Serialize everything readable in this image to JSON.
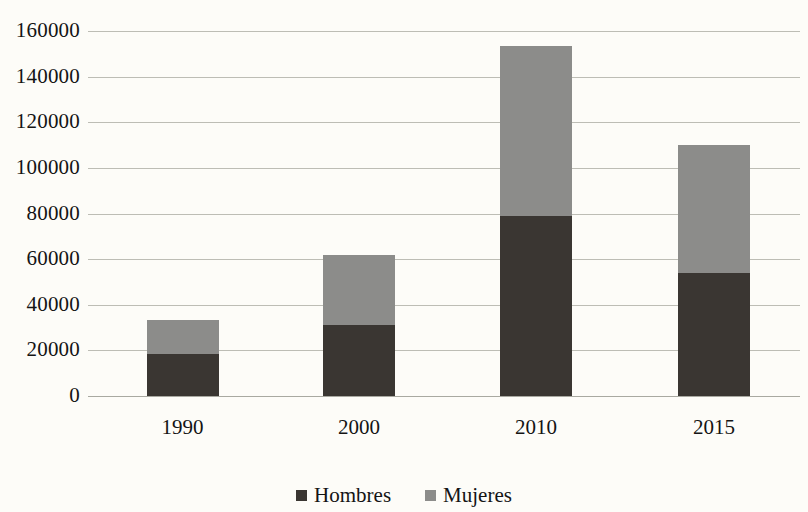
{
  "chart_data": {
    "type": "bar",
    "stacked": true,
    "title": "",
    "subtitle": "",
    "xlabel": "",
    "ylabel": "",
    "categories": [
      "1990",
      "2000",
      "2010",
      "2015"
    ],
    "series": [
      {
        "name": "Hombres",
        "color": "#3a3632",
        "values": [
          18400,
          31000,
          79000,
          54000
        ]
      },
      {
        "name": "Mujeres",
        "color": "#8c8c8a",
        "values": [
          14900,
          31000,
          74400,
          56000
        ]
      }
    ],
    "totals": [
      33300,
      62000,
      153400,
      110000
    ],
    "ylim": [
      0,
      160000
    ],
    "ytick_step": 20000,
    "yticks": [
      "160000",
      "140000",
      "120000",
      "100000",
      "80000",
      "60000",
      "40000",
      "20000",
      "0"
    ],
    "ytick_values": [
      160000,
      140000,
      120000,
      100000,
      80000,
      60000,
      40000,
      20000,
      0
    ],
    "grid": true,
    "grid_color": "#bdbdb5",
    "legend_position": "bottom",
    "legend": [
      "Hombres",
      "Mujeres"
    ],
    "background": "#fdfcf8"
  }
}
